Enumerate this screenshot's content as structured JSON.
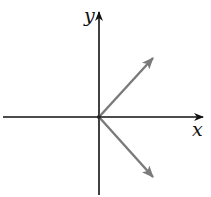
{
  "diagram": {
    "axes": {
      "x_label": "x",
      "y_label": "y",
      "axis_color": "#111111"
    },
    "vectors": [
      {
        "name": "upper-vector",
        "from": [
          98,
          117
        ],
        "to": [
          152,
          58
        ],
        "color": "#7a7a7a"
      },
      {
        "name": "lower-vector",
        "from": [
          98,
          117
        ],
        "to": [
          152,
          177
        ],
        "color": "#7a7a7a"
      }
    ]
  }
}
